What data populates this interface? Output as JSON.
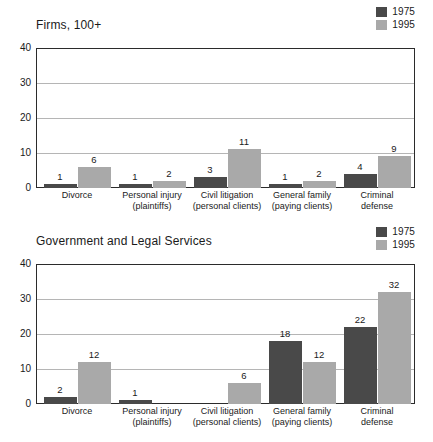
{
  "legend": {
    "series": [
      {
        "label": "1975",
        "color": "#494949"
      },
      {
        "label": "1995",
        "color": "#a9a9a9"
      }
    ]
  },
  "axis": {
    "ticks": [
      "40",
      "30",
      "20",
      "10",
      "0"
    ]
  },
  "categories": [
    {
      "line1": "Divorce",
      "line2": ""
    },
    {
      "line1": "Personal injury",
      "line2": "(plaintiffs)"
    },
    {
      "line1": "Civil litigation",
      "line2": "(personal clients)"
    },
    {
      "line1": "General family",
      "line2": "(paying clients)"
    },
    {
      "line1": "Criminal",
      "line2": "defense"
    }
  ],
  "charts": [
    {
      "title": "Firms, 100+",
      "values_1975": [
        "1",
        "1",
        "3",
        "1",
        "4"
      ],
      "values_1995": [
        "6",
        "2",
        "11",
        "2",
        "9"
      ]
    },
    {
      "title": "Government and Legal Services",
      "values_1975": [
        "2",
        "1",
        "",
        "18",
        "22"
      ],
      "values_1995": [
        "12",
        "",
        "6",
        "12",
        "32"
      ]
    }
  ],
  "chart_data": [
    {
      "type": "bar",
      "title": "Firms, 100+",
      "xlabel": "",
      "ylabel": "",
      "ylim": [
        0,
        40
      ],
      "yticks": [
        0,
        10,
        20,
        30,
        40
      ],
      "grid": true,
      "legend_position": "top-right",
      "categories": [
        "Divorce",
        "Personal injury (plaintiffs)",
        "Civil litigation (personal clients)",
        "General family (paying clients)",
        "Criminal defense"
      ],
      "series": [
        {
          "name": "1975",
          "color": "#494949",
          "values": [
            1,
            1,
            3,
            1,
            4
          ]
        },
        {
          "name": "1995",
          "color": "#a9a9a9",
          "values": [
            6,
            2,
            11,
            2,
            9
          ]
        }
      ]
    },
    {
      "type": "bar",
      "title": "Government and Legal Services",
      "xlabel": "",
      "ylabel": "",
      "ylim": [
        0,
        40
      ],
      "yticks": [
        0,
        10,
        20,
        30,
        40
      ],
      "grid": true,
      "legend_position": "top-right",
      "categories": [
        "Divorce",
        "Personal injury (plaintiffs)",
        "Civil litigation (personal clients)",
        "General family (paying clients)",
        "Criminal defense"
      ],
      "series": [
        {
          "name": "1975",
          "color": "#494949",
          "values": [
            2,
            1,
            null,
            18,
            22
          ]
        },
        {
          "name": "1995",
          "color": "#a9a9a9",
          "values": [
            12,
            null,
            6,
            12,
            32
          ]
        }
      ]
    }
  ]
}
